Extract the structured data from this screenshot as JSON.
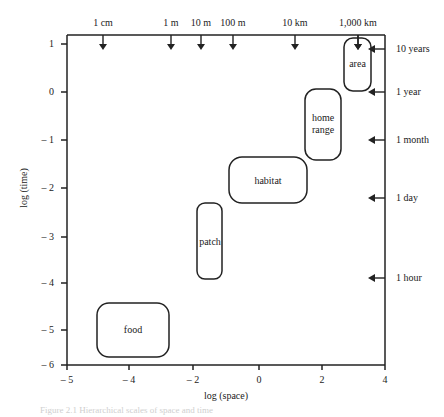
{
  "axes": {
    "xlabel": "log (space)",
    "ylabel": "log (time)",
    "xticks": [
      "– 5",
      "– 4",
      "– 2",
      "0",
      "2",
      "4"
    ],
    "yticks": [
      "1",
      "0",
      "– 1",
      "– 2",
      "– 3",
      "– 4",
      "– 5",
      "– 6"
    ]
  },
  "space_markers": [
    "1 cm",
    "1 m",
    "10 m",
    "100 m",
    "10 km",
    "1,000 km"
  ],
  "time_markers": [
    "10 years",
    "1 year",
    "1 month",
    "1 day",
    "1 hour"
  ],
  "scales": {
    "area": "area",
    "home_range_line1": "home",
    "home_range_line2": "range",
    "habitat": "habitat",
    "patch": "patch",
    "food": "food"
  },
  "caption": "Figure 2.1 Hierarchical scales of space and time"
}
